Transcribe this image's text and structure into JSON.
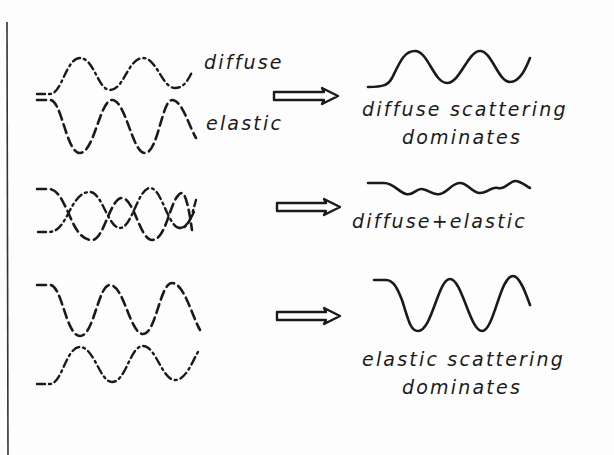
{
  "diagram": {
    "colors": {
      "ink": "#1a1a1a",
      "background": "#fdfdfd"
    },
    "rows": [
      {
        "inputs": [
          {
            "label": "diffuse",
            "style": "dash-dot"
          },
          {
            "label": "elastic",
            "style": "dashed"
          }
        ],
        "arrow": "double-line-right-arrow",
        "result": {
          "label_line1": "diffuse scattering",
          "label_line2": "dominates"
        }
      },
      {
        "inputs": [
          {
            "style": "dash-dot"
          },
          {
            "style": "dashed"
          }
        ],
        "arrow": "double-line-right-arrow",
        "result": {
          "label_line1": "diffuse+elastic"
        }
      },
      {
        "inputs": [
          {
            "style": "dashed"
          },
          {
            "style": "dash-dot"
          }
        ],
        "arrow": "double-line-right-arrow",
        "result": {
          "label_line1": "elastic scattering",
          "label_line2": "dominates"
        }
      }
    ]
  }
}
